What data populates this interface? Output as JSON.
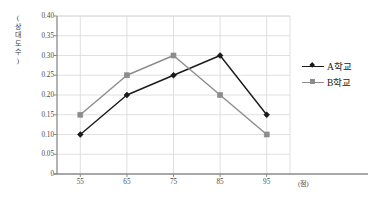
{
  "chart_data": {
    "type": "line",
    "title": "",
    "subtitle": "",
    "xlabel": "(점)",
    "ylabel": "(상대도수)",
    "ylabel_chars": "(\n상\n대\n도\n수\n)",
    "categories": [
      55,
      65,
      75,
      85,
      95
    ],
    "xtick_labels": [
      "55",
      "65",
      "75",
      "85",
      "95"
    ],
    "ytick_labels": [
      "0",
      "0.05",
      "0.10",
      "0.15",
      "0.20",
      "0.25",
      "0.30",
      "0.35",
      "0.40"
    ],
    "ytick_values": [
      0,
      0.05,
      0.1,
      0.15,
      0.2,
      0.25,
      0.3,
      0.35,
      0.4
    ],
    "xlim": [
      50,
      100
    ],
    "ylim": [
      0,
      0.4
    ],
    "grid": true,
    "grid_axes": "both",
    "legend_position": "right",
    "series": [
      {
        "name": "A학교",
        "values": [
          0.1,
          0.2,
          0.25,
          0.3,
          0.15
        ],
        "color": "#1a1a1a",
        "marker": "diamond"
      },
      {
        "name": "B학교",
        "values": [
          0.15,
          0.25,
          0.3,
          0.2,
          0.1
        ],
        "color": "#8c8c8c",
        "marker": "square"
      }
    ]
  },
  "legend": {
    "items": [
      {
        "label": "A학교",
        "color": "#1a1a1a"
      },
      {
        "label": "B학교",
        "color": "#8c8c8c"
      }
    ]
  },
  "colors": {
    "series_a": "#1a1a1a",
    "series_b": "#8c8c8c",
    "grid": "#d8d8d8",
    "axis": "#8a8a8a",
    "text": "#4a4a4a",
    "background": "#ffffff"
  }
}
